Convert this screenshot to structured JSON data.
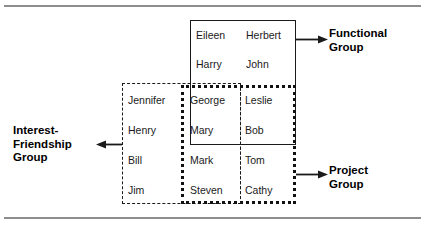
{
  "figure": {
    "groups": [
      {
        "id": "functional",
        "label_lines": [
          "Functional",
          "Group"
        ],
        "border_style": "solid",
        "members": [
          "Eileen",
          "Herbert",
          "Harry",
          "John",
          "George",
          "Leslie",
          "Mary",
          "Bob"
        ]
      },
      {
        "id": "interest-friendship",
        "label_lines": [
          "Interest-",
          "Friendship",
          "Group"
        ],
        "border_style": "dashed",
        "members": [
          "Jennifer",
          "Henry",
          "Bill",
          "Jim",
          "George",
          "Mary",
          "Mark",
          "Steven"
        ]
      },
      {
        "id": "project",
        "label_lines": [
          "Project",
          "Group"
        ],
        "border_style": "dotted",
        "members": [
          "George",
          "Leslie",
          "Mary",
          "Bob",
          "Mark",
          "Tom",
          "Steven",
          "Cathy"
        ]
      }
    ],
    "names": [
      {
        "text": "Eileen",
        "x": 196,
        "y": 29
      },
      {
        "text": "Herbert",
        "x": 246,
        "y": 29
      },
      {
        "text": "Harry",
        "x": 196,
        "y": 58
      },
      {
        "text": "John",
        "x": 246,
        "y": 58
      },
      {
        "text": "Jennifer",
        "x": 128,
        "y": 94
      },
      {
        "text": "George",
        "x": 190,
        "y": 94
      },
      {
        "text": "Leslie",
        "x": 245,
        "y": 94
      },
      {
        "text": "Henry",
        "x": 128,
        "y": 124
      },
      {
        "text": "Mary",
        "x": 190,
        "y": 124
      },
      {
        "text": "Bob",
        "x": 245,
        "y": 124
      },
      {
        "text": "Bill",
        "x": 128,
        "y": 154
      },
      {
        "text": "Mark",
        "x": 190,
        "y": 154
      },
      {
        "text": "Tom",
        "x": 245,
        "y": 154
      },
      {
        "text": "Jim",
        "x": 128,
        "y": 184
      },
      {
        "text": "Steven",
        "x": 190,
        "y": 184
      },
      {
        "text": "Cathy",
        "x": 245,
        "y": 184
      }
    ],
    "colors": {
      "ink": "#1a1a1a",
      "rule": "#8e8e8e",
      "background": "#ffffff"
    }
  }
}
